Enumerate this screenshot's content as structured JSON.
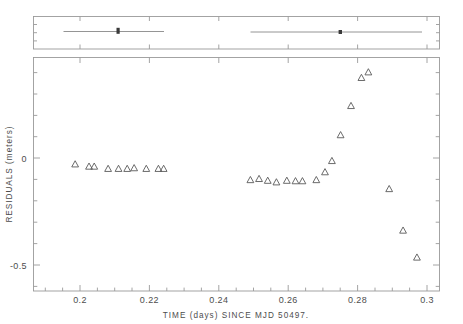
{
  "figure": {
    "title": "",
    "background": "#ffffff",
    "ink_color": "#4d4d4d"
  },
  "axis_titles": {
    "xlabel": "TIME (days) SINCE MJD 50497.",
    "ylabel": "RESIDUALS (meters)"
  },
  "x_ticklabels": [
    "0.2",
    "0.22",
    "0.24",
    "0.26",
    "0.28",
    "0.3"
  ],
  "y_ticklabels": [
    "0",
    "-0.5"
  ],
  "chart_data": {
    "type": "scatter",
    "title": "",
    "xlabel": "TIME (days) SINCE MJD 50497.",
    "ylabel": "RESIDUALS (meters)",
    "xlim": [
      0.1925,
      0.3095
    ],
    "ylim": [
      -0.62,
      0.42
    ],
    "xticks": [
      0.2,
      0.22,
      0.24,
      0.26,
      0.28,
      0.3
    ],
    "yticks": [
      0.0,
      -0.5
    ],
    "y_minor_ticks": [
      0.4,
      0.3,
      0.2,
      0.1,
      -0.1,
      -0.2,
      -0.3,
      -0.4,
      -0.6
    ],
    "grid": false,
    "legend": null,
    "marker": "open-triangle-up",
    "marker_color": "#5a5a5a",
    "series": [
      {
        "name": "residuals",
        "x": [
          0.2045,
          0.2085,
          0.21,
          0.214,
          0.217,
          0.2195,
          0.2215,
          0.225,
          0.2285,
          0.23,
          0.255,
          0.2575,
          0.26,
          0.2625,
          0.2655,
          0.268,
          0.27,
          0.274,
          0.2765,
          0.2785,
          0.281,
          0.284,
          0.287,
          0.289,
          0.295,
          0.299,
          0.303
        ],
        "y": [
          -0.055,
          -0.065,
          -0.065,
          -0.075,
          -0.075,
          -0.075,
          -0.072,
          -0.075,
          -0.075,
          -0.075,
          -0.125,
          -0.12,
          -0.128,
          -0.135,
          -0.128,
          -0.13,
          -0.13,
          -0.125,
          -0.09,
          -0.04,
          0.075,
          0.205,
          0.33,
          0.355,
          -0.165,
          -0.35,
          -0.47
        ]
      }
    ]
  },
  "top_panel": {
    "type": "errorbar-strip",
    "description": "coverage intervals with central points",
    "xlim": [
      0.1925,
      0.3095
    ],
    "bars": [
      {
        "x_center": 0.2128,
        "x_low": 0.201,
        "x_high": 0.23,
        "y": 0.0
      },
      {
        "x_center": 0.2765,
        "x_low": 0.2548,
        "x_high": 0.3042,
        "y": 0.0
      }
    ],
    "xticks": [
      0.2,
      0.22,
      0.24,
      0.26,
      0.28,
      0.3
    ]
  }
}
